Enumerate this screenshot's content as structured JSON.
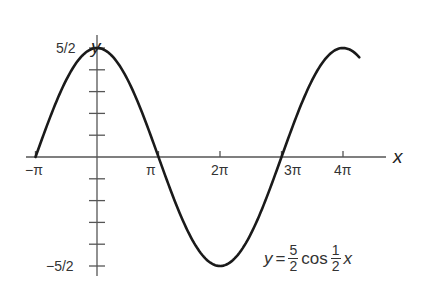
{
  "chart_data": {
    "type": "line",
    "title": "",
    "function": "y = (5/2) cos((1/2) x)",
    "xlabel": "x",
    "ylabel": "y",
    "x_ticks": [
      "−π",
      "π",
      "2π",
      "3π",
      "4π"
    ],
    "x_tick_values": [
      -3.1416,
      3.1416,
      6.2832,
      9.4248,
      12.5664
    ],
    "y_tick_labels": [
      "5/2",
      "−5/2"
    ],
    "y_tick_values": [
      2.5,
      2.0,
      1.5,
      1.0,
      0.5,
      -0.5,
      -1.0,
      -1.5,
      -2.0,
      -2.5
    ],
    "xlim": [
      -3.1416,
      13.4
    ],
    "ylim": [
      -2.5,
      2.5
    ],
    "grid": false,
    "series": [
      {
        "name": "y = 5/2 cos 1/2 x",
        "x": [
          -3.1416,
          0,
          3.1416,
          6.2832,
          9.4248,
          12.5664,
          13.4
        ],
        "values": [
          0,
          2.5,
          0,
          -2.5,
          0,
          2.5,
          2.27
        ]
      }
    ],
    "annotation": {
      "y": "y",
      "equals": "=",
      "coef_num": "5",
      "coef_den": "2",
      "func": "cos",
      "arg_num": "1",
      "arg_den": "2",
      "var": "x"
    }
  }
}
